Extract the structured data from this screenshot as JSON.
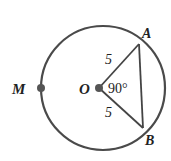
{
  "diagram": {
    "type": "circle-geometry",
    "colors": {
      "stroke": "#444444",
      "text": "#222222",
      "background": "#ffffff"
    },
    "circle": {
      "cx": 103,
      "cy": 88,
      "r": 62
    },
    "points": {
      "O": {
        "label": "O",
        "x": 99,
        "y": 88
      },
      "M": {
        "label": "M",
        "x": 41,
        "y": 88
      },
      "A": {
        "label": "A",
        "x": 139,
        "y": 44
      },
      "B": {
        "label": "B",
        "x": 143,
        "y": 128
      }
    },
    "segments": [
      {
        "from": "O",
        "to": "A",
        "length_label": "5"
      },
      {
        "from": "O",
        "to": "B",
        "length_label": "5"
      },
      {
        "from": "A",
        "to": "B",
        "length_label": ""
      }
    ],
    "angle_label": "90°"
  }
}
